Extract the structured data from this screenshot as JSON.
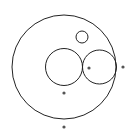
{
  "diagram": {
    "background": "#ffffff",
    "stroke_color": "#222222",
    "dot_color": "#555555",
    "circles": [
      {
        "name": "outer-circle",
        "cx": 64,
        "cy": 67,
        "r": 52
      },
      {
        "name": "small-top-circle",
        "cx": 82,
        "cy": 37,
        "r": 6
      },
      {
        "name": "middle-left-circle",
        "cx": 64,
        "cy": 67,
        "r": 18.5
      },
      {
        "name": "right-circle",
        "cx": 99.5,
        "cy": 67,
        "r": 17
      }
    ],
    "points": [
      {
        "name": "point-right-circle-center",
        "cx": 89,
        "cy": 68
      },
      {
        "name": "point-outside-right",
        "cx": 123,
        "cy": 67
      },
      {
        "name": "point-below-middle",
        "cx": 64,
        "cy": 93
      },
      {
        "name": "point-below-outer",
        "cx": 64,
        "cy": 127
      }
    ]
  }
}
